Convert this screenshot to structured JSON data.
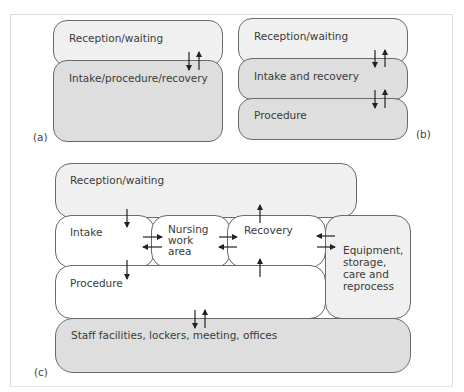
{
  "panels": {
    "a": {
      "label": "(a)",
      "rooms": {
        "reception": "Reception/waiting",
        "intake": "Intake/procedure/recovery"
      }
    },
    "b": {
      "label": "(b)",
      "rooms": {
        "reception": "Reception/waiting",
        "intake": "Intake and recovery",
        "procedure": "Procedure"
      }
    },
    "c": {
      "label": "(c)",
      "rooms": {
        "reception": "Reception/waiting",
        "intake": "Intake",
        "nursing_line1": "Nursing",
        "nursing_line2": "work",
        "nursing_line3": "area",
        "recovery": "Recovery",
        "equipment_line1": "Equipment,",
        "equipment_line2": "storage,",
        "equipment_line3": "care and",
        "equipment_line4": "reprocess",
        "procedure": "Procedure",
        "staff": "Staff facilities, lockers, meeting, offices"
      }
    }
  },
  "colors": {
    "light_fill": "#f0f0f0",
    "mid_fill": "#dedede",
    "border": "#6a6a6a",
    "arrow": "#222222"
  }
}
